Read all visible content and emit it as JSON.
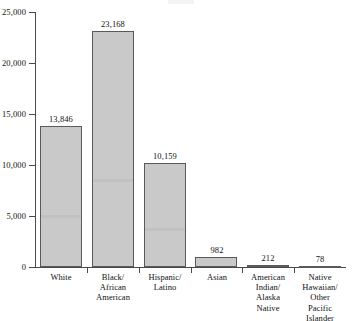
{
  "chart_data": {
    "type": "bar",
    "title": "",
    "subtitle": "",
    "xlabel": "",
    "ylabel": "",
    "ylim": [
      0,
      25000
    ],
    "grid": false,
    "legend": false,
    "orientation": "vertical",
    "categories": [
      "White",
      "Black/\nAfrican\nAmerican",
      "Hispanic/\nLatino",
      "Asian",
      "American\nIndian/\nAlaska\nNative",
      "Native\nHawaiian/\nOther\nPacific\nIslander"
    ],
    "category_lines": [
      [
        "White"
      ],
      [
        "Black/",
        "African",
        "American"
      ],
      [
        "Hispanic/",
        "Latino"
      ],
      [
        "Asian"
      ],
      [
        "American",
        "Indian/",
        "Alaska",
        "Native"
      ],
      [
        "Native",
        "Hawaiian/",
        "Other",
        "Pacific",
        "Islander"
      ]
    ],
    "values": [
      13846,
      23168,
      10159,
      982,
      212,
      78
    ],
    "value_labels": [
      "13,846",
      "23,168",
      "10,159",
      "982",
      "212",
      "78"
    ],
    "ytick_values": [
      25000,
      20000,
      15000,
      10000,
      5000,
      0
    ],
    "ytick_labels": [
      "25,000",
      "20,000",
      "15,000",
      "10,000",
      "5,000",
      "0"
    ],
    "colors": {
      "bar_fill": "#c9c9c9",
      "bar_stroke": "#5a5a5a",
      "axis": "#4a4a4a",
      "text": "#111111",
      "background": "#ffffff"
    }
  }
}
